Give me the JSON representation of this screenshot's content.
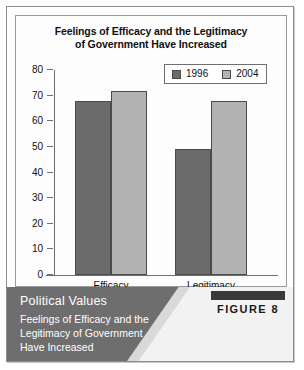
{
  "figure": {
    "badge_label": "FIGURE 8",
    "caption_heading": "Political Values",
    "caption_line1": "Feelings of Efficacy and the",
    "caption_line2": "Legitimacy of Government",
    "caption_line3": "Have Increased"
  },
  "chart_data": {
    "type": "bar",
    "title": "Feelings of Efficacy and the Legitimacy of Government Have Increased",
    "title_line1": "Feelings of Efficacy and the Legitimacy",
    "title_line2": "of Government Have Increased",
    "categories": [
      "Efficacy",
      "Legitimacy"
    ],
    "series": [
      {
        "name": "1996",
        "values": [
          68,
          49
        ],
        "color": "#6b6b6b"
      },
      {
        "name": "2004",
        "values": [
          72,
          68
        ],
        "color": "#b2b2b2"
      }
    ],
    "xlabel": "",
    "ylabel": "",
    "ylim": [
      0,
      80
    ],
    "yticks": [
      0,
      10,
      20,
      30,
      40,
      50,
      60,
      70,
      80
    ],
    "ytick_labels": [
      "0",
      "10",
      "20",
      "30",
      "40",
      "50",
      "60",
      "70",
      "80"
    ],
    "grid": false,
    "legend_position": "top-right",
    "legend_entries": [
      "1996",
      "2004"
    ]
  }
}
